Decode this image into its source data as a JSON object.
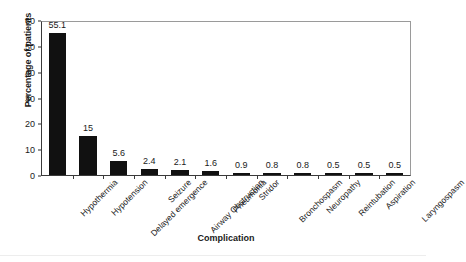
{
  "chart_data": {
    "type": "bar",
    "title": "",
    "xlabel": "Complication",
    "ylabel": "Percentage of patients",
    "ylim": [
      0,
      60
    ],
    "yticks": [
      0,
      10,
      20,
      30,
      40,
      50,
      60
    ],
    "grid": false,
    "legend": false,
    "bar_color": "#111111",
    "categories": [
      "Hypothermia",
      "Hypotension",
      "Delayed emergence",
      "Seizure",
      "Airway Obstruction",
      "Pneumonia",
      "Stridor",
      "Bronchospasm",
      "Neuropathy",
      "Reintubation",
      "Aspiration",
      "Laryngospasm"
    ],
    "values": [
      55.1,
      15,
      5.6,
      2.4,
      2.1,
      1.6,
      0.9,
      0.8,
      0.8,
      0.5,
      0.5,
      0.5
    ],
    "value_labels": [
      "55.1",
      "15",
      "5.6",
      "2.4",
      "2.1",
      "1.6",
      "0.9",
      "0.8",
      "0.8",
      "0.5",
      "0.5",
      "0.5"
    ]
  }
}
